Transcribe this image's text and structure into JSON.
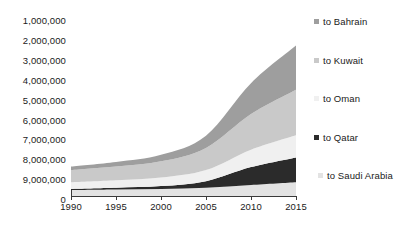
{
  "chart_data": {
    "type": "area",
    "stacked": true,
    "title": "",
    "xlabel": "",
    "ylabel": "",
    "x": [
      1990,
      1995,
      2000,
      2005,
      2010,
      2015
    ],
    "xlim": [
      1990,
      2015
    ],
    "xticks": [
      "1990",
      "1995",
      "2000",
      "2005",
      "2010",
      "2015"
    ],
    "yticks": [
      "1,000,000",
      "2,000,000",
      "3,000,000",
      "4,000,000",
      "5,000,000",
      "6,000,000",
      "7,000,000",
      "8,000,000",
      "9,000,000",
      "0"
    ],
    "ytick_values": [
      1000000,
      2000000,
      3000000,
      4000000,
      5000000,
      6000000,
      7000000,
      8000000,
      9000000,
      0
    ],
    "y_axis_inverted": true,
    "ylim": [
      0,
      9500000
    ],
    "grid": false,
    "legend_position": "right",
    "series": [
      {
        "name": "to Saudi Arabia",
        "color": "#e3e3e3",
        "values": [
          300000,
          330000,
          360000,
          420000,
          560000,
          700000
        ]
      },
      {
        "name": "to Qatar",
        "color": "#2b2b2b",
        "values": [
          60000,
          90000,
          140000,
          330000,
          900000,
          1250000
        ]
      },
      {
        "name": "to Oman",
        "color": "#f0f0f0",
        "values": [
          330000,
          370000,
          430000,
          560000,
          880000,
          1120000
        ]
      },
      {
        "name": "to Kuwait",
        "color": "#c9c9c9",
        "values": [
          620000,
          700000,
          820000,
          1120000,
          1800000,
          2300000
        ]
      },
      {
        "name": "to Bahrain",
        "color": "#9e9e9e",
        "values": [
          180000,
          230000,
          330000,
          620000,
          1560000,
          2230000
        ]
      }
    ],
    "legend_order": [
      "to Bahrain",
      "to Kuwait",
      "to Oman",
      "to Qatar",
      "to Saudi Arabia"
    ],
    "legend_entries": [
      {
        "label": "to Bahrain",
        "color": "#9e9e9e"
      },
      {
        "label": "to Kuwait",
        "color": "#c9c9c9"
      },
      {
        "label": "to Oman",
        "color": "#f0f0f0"
      },
      {
        "label": "to Qatar",
        "color": "#2b2b2b"
      },
      {
        "label": "to Saudi Arabia",
        "color": "#e3e3e3"
      }
    ],
    "axis_color": "#3a3a3a",
    "background": "#ffffff"
  }
}
